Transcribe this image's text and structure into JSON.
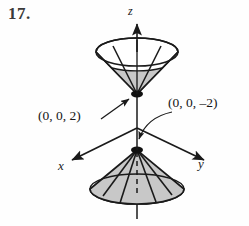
{
  "figure": {
    "problem_number": "17.",
    "background_color": "#fefefe",
    "ink_color": "#1a1a1a",
    "shade_color": "#c8c8c8"
  },
  "axes": {
    "z": {
      "label": "z",
      "direction": "up",
      "arrow": true
    },
    "x": {
      "label": "x",
      "direction": "down-left",
      "arrow": true
    },
    "y": {
      "label": "y",
      "direction": "down-right",
      "arrow": true
    }
  },
  "annotations": [
    {
      "name": "upper-vertex",
      "text": "(0, 0, 2)",
      "leader": "straight-arrow",
      "points_to": "upper-cone-vertex"
    },
    {
      "name": "lower-vertex",
      "text": "(0, 0, –2)",
      "leader": "curved-arrow",
      "points_to": "lower-cone-vertex"
    }
  ],
  "shapes": {
    "upper_cone": {
      "name": "upper-cone",
      "orientation": "opens-upward",
      "vertex": "(0, 0, 2)",
      "rim_filled": false,
      "inner_band_shaded": true
    },
    "lower_cone": {
      "name": "lower-cone",
      "orientation": "opens-downward",
      "vertex": "(0, 0, –2)",
      "base_filled": true,
      "fill": "#c8c8c8"
    }
  }
}
